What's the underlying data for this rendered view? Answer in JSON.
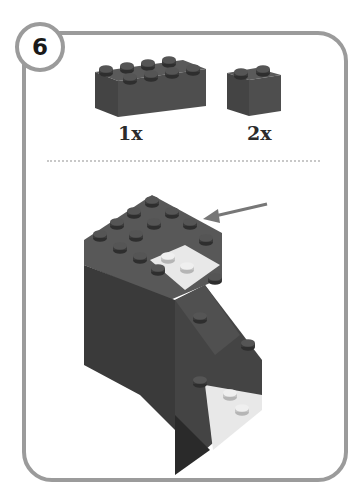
{
  "step": {
    "number": "6"
  },
  "parts": [
    {
      "name": "brick-2x4",
      "quantity_label": "1x"
    },
    {
      "name": "brick-1x2",
      "quantity_label": "2x"
    }
  ],
  "colors": {
    "frame": "#9b9b9b",
    "brick_dark": "#4a4a4a",
    "brick_light": "#e6e6e6",
    "arrow": "#777777"
  }
}
